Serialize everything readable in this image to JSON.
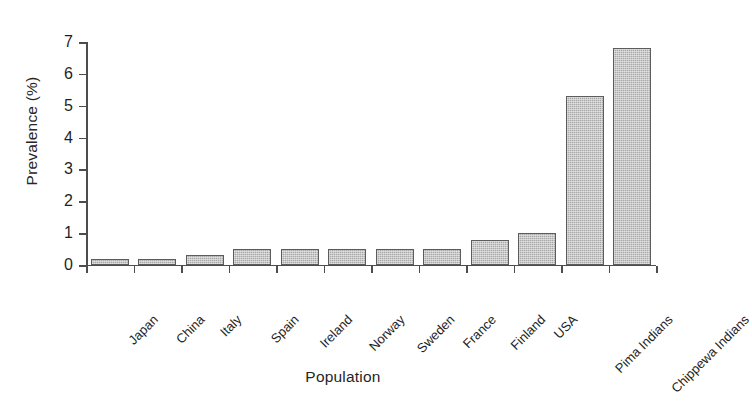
{
  "chart_data": {
    "type": "bar",
    "title": "",
    "xlabel": "Population",
    "ylabel": "Prevalence (%)",
    "categories": [
      "Japan",
      "China",
      "Italy",
      "Spain",
      "Ireland",
      "Norway",
      "Sweden",
      "France",
      "Finland",
      "USA",
      "Pima Indians",
      "Chippewa Indians"
    ],
    "values": [
      0.2,
      0.2,
      0.3,
      0.5,
      0.5,
      0.5,
      0.5,
      0.5,
      0.8,
      1.0,
      5.3,
      6.8
    ],
    "ylim": [
      0,
      7
    ],
    "ytick_labels": [
      "0",
      "1",
      "2",
      "3",
      "4",
      "5",
      "6",
      "7"
    ],
    "ytick_values": [
      0,
      1,
      2,
      3,
      4,
      5,
      6,
      7
    ],
    "grid": false,
    "legend": false,
    "bar_color": "#aaaaaa",
    "bar_edge_color": "#5c5c5c",
    "axis_color": "#4d4d4d",
    "background_color": "#ffffff"
  }
}
